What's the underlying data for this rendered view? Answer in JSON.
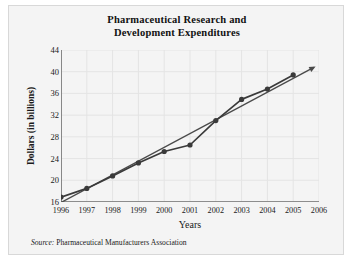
{
  "chart_data": {
    "type": "line",
    "title": "Pharmaceutical Research and Development Expenditures",
    "title_lines": [
      "Pharmaceutical Research and",
      "Development Expenditures"
    ],
    "xlabel": "Years",
    "ylabel": "Dollars (in billions)",
    "categories": [
      1996,
      1997,
      1998,
      1999,
      2000,
      2001,
      2002,
      2003,
      2004,
      2005
    ],
    "x_tick_labels": [
      "1996",
      "1997",
      "1998",
      "1999",
      "2000",
      "2001",
      "2002",
      "2003",
      "2004",
      "2005",
      "2006"
    ],
    "y_tick_labels": [
      "16",
      "20",
      "24",
      "28",
      "32",
      "36",
      "40",
      "44"
    ],
    "values": [
      16.9,
      18.5,
      20.8,
      23.2,
      25.3,
      26.5,
      31.0,
      34.9,
      36.8,
      39.4
    ],
    "series": [
      {
        "name": "Expenditures",
        "marker": "filled-circle",
        "color": "#3a3a3a",
        "x": [
          1996,
          1997,
          1998,
          1999,
          2000,
          2001,
          2002,
          2003,
          2004,
          2005
        ],
        "values": [
          16.9,
          18.5,
          20.8,
          23.2,
          25.3,
          26.5,
          31.0,
          34.9,
          36.8,
          39.4
        ]
      },
      {
        "name": "Trend line",
        "marker": "none",
        "arrow_end": true,
        "color": "#4a4a4a",
        "x": [
          1996,
          2005.8
        ],
        "values": [
          15.9,
          40.8
        ]
      }
    ],
    "xlim": [
      1996,
      2006
    ],
    "ylim": [
      16,
      44
    ],
    "y_axis_broken": true,
    "grid": true,
    "grid_color": "#e4e4e4",
    "legend": null,
    "axis_color": "#6e6e6e",
    "background": "#f4f4f4"
  },
  "source": {
    "prefix": "Source:",
    "text": "Pharmaceutical Manufacturers Association"
  }
}
